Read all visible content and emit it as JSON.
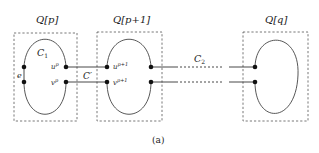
{
  "figure": {
    "caption": "(a)",
    "groups": [
      {
        "id": "qp",
        "label": "Q[p]",
        "cycle_label": "C1",
        "side_edge_label": "e",
        "top_vertex_label": "u^p",
        "bottom_vertex_label": "v^p"
      },
      {
        "id": "qp1",
        "label": "Q[p+1]",
        "top_vertex_label": "u^{p+1}",
        "bottom_vertex_label": "v^{p+1}"
      },
      {
        "id": "qq",
        "label": "Q[q]"
      }
    ],
    "connector_labels": {
      "between_p_p1": "C'",
      "between_p1_q": "C2"
    }
  },
  "text": {
    "qp": "Q[p]",
    "qp1": "Q[p+1]",
    "qq": "Q[q]",
    "c1_main": "C",
    "c1_sub": "1",
    "c2_main": "C",
    "c2_sub": "2",
    "cprime": "C′",
    "e": "e",
    "up_main": "u",
    "up_sup": "p",
    "vp_main": "v",
    "vp_sup": "p",
    "up1_main": "u",
    "up1_sup": "p+1",
    "vp1_main": "v",
    "vp1_sup": "p+1",
    "caption": "(a)"
  }
}
